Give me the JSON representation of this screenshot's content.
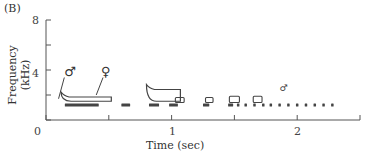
{
  "figure": {
    "panel_label": "(B)"
  },
  "chart_data": {
    "type": "spectrogram",
    "title": "",
    "xlabel": "Time (sec)",
    "ylabel": "Frequency (kHz)",
    "xlim": [
      0,
      2.5
    ],
    "ylim": [
      0,
      8
    ],
    "x_ticks": [
      0,
      0.5,
      1,
      1.5,
      2,
      2.5
    ],
    "x_tick_labels": [
      "0",
      "1",
      "2"
    ],
    "y_ticks": [
      0,
      2,
      4,
      6,
      8
    ],
    "y_tick_labels": [
      "0",
      "4",
      "8"
    ],
    "grid": false,
    "legend": null,
    "annotations": [
      {
        "symbol": "♂",
        "meaning": "male",
        "x": 0.13,
        "y": 3.8
      },
      {
        "symbol": "♀",
        "meaning": "female",
        "x": 0.47,
        "y": 3.8
      },
      {
        "symbol": "♂",
        "meaning": "male (small, later)",
        "x": 1.86,
        "y": 2.5
      }
    ],
    "male_notes": [
      {
        "t_start": 0.15,
        "t_end": 0.42,
        "freq_khz": 1.2
      },
      {
        "t_start": 0.6,
        "t_end": 0.67,
        "freq_khz": 1.2
      },
      {
        "t_start": 0.82,
        "t_end": 0.9,
        "freq_khz": 1.2
      },
      {
        "t_start": 0.98,
        "t_end": 1.05,
        "freq_khz": 1.2
      },
      {
        "t_start": 1.25,
        "t_end": 1.3,
        "freq_khz": 1.2
      },
      {
        "t_start": 1.45,
        "t_end": 1.49,
        "freq_khz": 1.2
      },
      {
        "t_start": 1.52,
        "t_end": 1.53,
        "freq_khz": 1.2
      },
      {
        "t_start": 1.58,
        "t_end": 1.59,
        "freq_khz": 1.2
      },
      {
        "t_start": 1.65,
        "t_end": 1.66,
        "freq_khz": 1.2
      },
      {
        "t_start": 1.72,
        "t_end": 1.73,
        "freq_khz": 1.2
      },
      {
        "t_start": 1.78,
        "t_end": 1.79,
        "freq_khz": 1.2
      },
      {
        "t_start": 1.85,
        "t_end": 1.86,
        "freq_khz": 1.2
      },
      {
        "t_start": 1.92,
        "t_end": 1.93,
        "freq_khz": 1.2
      },
      {
        "t_start": 1.99,
        "t_end": 2.0,
        "freq_khz": 1.2
      },
      {
        "t_start": 2.06,
        "t_end": 2.07,
        "freq_khz": 1.2
      },
      {
        "t_start": 2.13,
        "t_end": 2.14,
        "freq_khz": 1.2
      },
      {
        "t_start": 2.2,
        "t_end": 2.21,
        "freq_khz": 1.2
      },
      {
        "t_start": 2.27,
        "t_end": 2.28,
        "freq_khz": 1.2
      }
    ],
    "female_notes": [
      {
        "t_start": 0.12,
        "t_end": 0.52,
        "freq_low_khz": 1.5,
        "freq_high_khz": 2.0,
        "shape": "upsweep-start"
      },
      {
        "t_start": 0.8,
        "t_end": 1.07,
        "freq_low_khz": 1.5,
        "freq_high_khz": 2.6,
        "shape": "upsweep-start"
      },
      {
        "t_start": 1.03,
        "t_end": 1.1,
        "freq_low_khz": 1.4,
        "freq_high_khz": 1.8
      },
      {
        "t_start": 1.27,
        "t_end": 1.33,
        "freq_low_khz": 1.4,
        "freq_high_khz": 1.8
      },
      {
        "t_start": 1.46,
        "t_end": 1.54,
        "freq_low_khz": 1.4,
        "freq_high_khz": 1.9
      },
      {
        "t_start": 1.65,
        "t_end": 1.72,
        "freq_low_khz": 1.4,
        "freq_high_khz": 1.9
      }
    ]
  }
}
